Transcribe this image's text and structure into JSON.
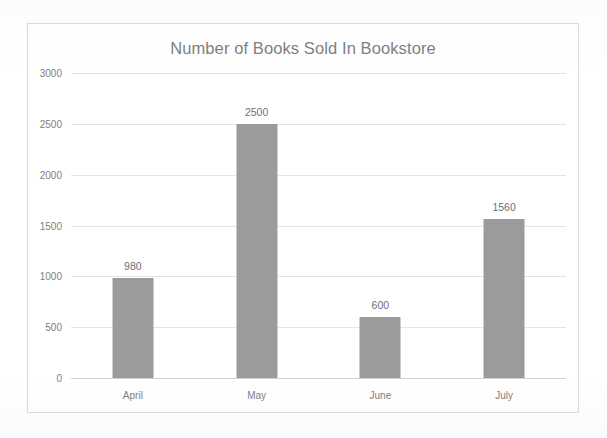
{
  "chart_data": {
    "type": "bar",
    "title": "Number of Books Sold In Bookstore",
    "xlabel": "",
    "ylabel": "",
    "categories": [
      "April",
      "May",
      "June",
      "July"
    ],
    "values": [
      980,
      2500,
      600,
      1560
    ],
    "data_labels": [
      "980",
      "2500",
      "600",
      "1560"
    ],
    "ylim": [
      0,
      3000
    ],
    "y_ticks": [
      3000,
      2500,
      2000,
      1500,
      1000,
      500,
      0
    ],
    "y_tick_labels": [
      "3000",
      "2500",
      "2000",
      "1500",
      "1000",
      "500",
      "0"
    ],
    "grid": true,
    "legend": false,
    "legend_position": "none",
    "series": [
      {
        "name": "Books Sold",
        "values": [
          980,
          2500,
          600,
          1560
        ]
      }
    ]
  },
  "style": {
    "bar_color": "#9b9b9b",
    "title_color": "#7f7f7f",
    "tick_color": "#808080",
    "gridline_color": "#e4e4e4",
    "baseline_color": "#d2d2d2",
    "frame_border_color": "#dcdcdc",
    "background_color": "#ffffff",
    "data_label_color": "#6f6f6f"
  }
}
